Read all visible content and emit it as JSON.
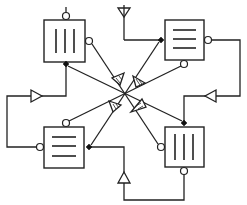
{
  "diagram": {
    "title": "",
    "colors": {
      "stroke": "#222222",
      "background": "#ffffff",
      "port_filled": "#111111"
    },
    "blocks": [
      {
        "id": "block-top-left",
        "pattern": "vertical-bars",
        "bars": 3
      },
      {
        "id": "block-top-right",
        "pattern": "horizontal-bars",
        "bars": 3
      },
      {
        "id": "block-bottom-left",
        "pattern": "horizontal-bars",
        "bars": 3
      },
      {
        "id": "block-bottom-right",
        "pattern": "vertical-bars",
        "bars": 3
      }
    ],
    "symbols": [
      {
        "id": "antenna",
        "type": "antenna-icon"
      },
      {
        "id": "tri-left",
        "type": "triangle-right"
      },
      {
        "id": "tri-right",
        "type": "triangle-left"
      },
      {
        "id": "tri-bottom",
        "type": "triangle-up"
      }
    ],
    "arrows": 4
  }
}
